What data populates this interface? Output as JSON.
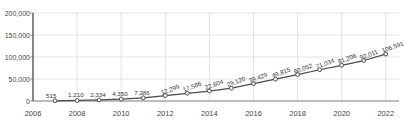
{
  "chart_data": {
    "type": "line",
    "title": "",
    "subtitle": "",
    "xlabel": "",
    "ylabel": "",
    "x": [
      2007,
      2008,
      2009,
      2010,
      2011,
      2012,
      2013,
      2014,
      2015,
      2016,
      2017,
      2018,
      2019,
      2020,
      2021,
      2022
    ],
    "values": [
      515,
      1210,
      2334,
      4350,
      7286,
      12299,
      17586,
      22604,
      29120,
      39429,
      49815,
      60052,
      71034,
      81206,
      92011,
      106591
    ],
    "point_labels": [
      "515",
      "1,210",
      "2,334",
      "4,350",
      "7,286",
      "12,299",
      "17,586",
      "22,604",
      "29,120",
      "39,429",
      "49,815",
      "60,052",
      "71,034",
      "81,206",
      "92,011",
      "106,591"
    ],
    "series": [
      {
        "name": "",
        "values": [
          515,
          1210,
          2334,
          4350,
          7286,
          12299,
          17586,
          22604,
          29120,
          39429,
          49815,
          60052,
          71034,
          81206,
          92011,
          106591
        ]
      }
    ],
    "xlim": [
      2006,
      2022.6
    ],
    "ylim": [
      0,
      200000
    ],
    "ytick_values": [
      0,
      50000,
      100000,
      150000,
      200000
    ],
    "ytick_labels": [
      "0",
      "50,000",
      "100,000",
      "150,000",
      "200,000"
    ],
    "xtick_values": [
      2006,
      2008,
      2010,
      2012,
      2014,
      2016,
      2018,
      2020,
      2022
    ],
    "xtick_labels": [
      "2006",
      "2008",
      "2010",
      "2012",
      "2014",
      "2016",
      "2018",
      "2020",
      "2022"
    ],
    "grid": true,
    "grid_x": true,
    "grid_y": true,
    "legend": false,
    "legend_position": "none",
    "marker": "open-circle",
    "colors": {
      "line": "#4a4a4a",
      "marker_edge": "#4a4a4a",
      "marker_face": "#ffffff",
      "grid": "#d9d9d9",
      "axis": "#7a7a7a",
      "text": "#444444",
      "background": "#ffffff"
    }
  }
}
